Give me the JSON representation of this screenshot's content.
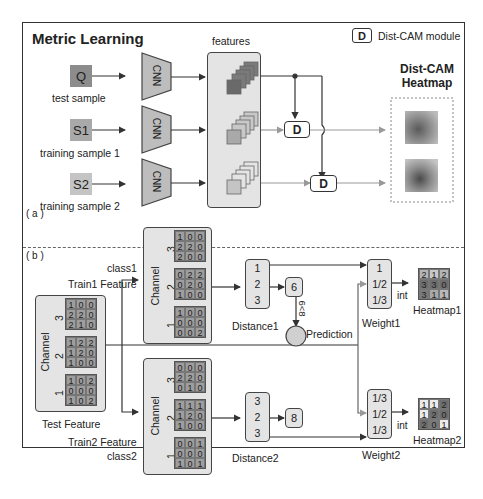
{
  "panel_a": {
    "label": "( a )",
    "title": "Metric Learning",
    "legend": {
      "icon_letter": "D",
      "text": "Dist-CAM module"
    },
    "features_label": "features",
    "heatmap_title_line1": "Dist-CAM",
    "heatmap_title_line2": "Heatmap",
    "samples": [
      {
        "letter": "Q",
        "caption": "test sample",
        "color": "#8c8c8c"
      },
      {
        "letter": "S1",
        "caption": "training sample 1",
        "color": "#a9a9a9"
      },
      {
        "letter": "S2",
        "caption": "training sample 2",
        "color": "#c4c4c4"
      }
    ],
    "cnn_label": "CNN",
    "dist_module_label": "D"
  },
  "panel_b": {
    "label": "( b )",
    "channel_label": "Channel",
    "test_feature": {
      "caption": "Test Feature",
      "channels": [
        {
          "name": "3",
          "rows": [
            [
              "1",
              "0",
              "0"
            ],
            [
              "2",
              "2",
              "0"
            ],
            [
              "2",
              "1",
              "0"
            ]
          ]
        },
        {
          "name": "2",
          "rows": [
            [
              "1",
              "2",
              "2"
            ],
            [
              "1",
              "2",
              "0"
            ],
            [
              "1",
              "0",
              "0"
            ]
          ]
        },
        {
          "name": "1",
          "rows": [
            [
              "1",
              "0",
              "2"
            ],
            [
              "0",
              "0",
              "0"
            ],
            [
              "1",
              "0",
              "2"
            ]
          ]
        }
      ]
    },
    "train1": {
      "class_label": "class1",
      "caption": "Train1 Feature",
      "channels": [
        {
          "name": "3",
          "rows": [
            [
              "1",
              "0",
              "0"
            ],
            [
              "2",
              "2",
              "0"
            ],
            [
              "2",
              "0",
              "0"
            ]
          ]
        },
        {
          "name": "2",
          "rows": [
            [
              "0",
              "2",
              "2"
            ],
            [
              "0",
              "2",
              "0"
            ],
            [
              "1",
              "0",
              "0"
            ]
          ]
        },
        {
          "name": "1",
          "rows": [
            [
              "1",
              "0",
              "0"
            ],
            [
              "0",
              "0",
              "0"
            ],
            [
              "0",
              "0",
              "2"
            ]
          ]
        }
      ]
    },
    "train2": {
      "class_label": "class2",
      "caption": "Train2 Feature",
      "channels": [
        {
          "name": "3",
          "rows": [
            [
              "0",
              "0",
              "0"
            ],
            [
              "2",
              "2",
              "0"
            ],
            [
              "0",
              "1",
              "0"
            ]
          ]
        },
        {
          "name": "2",
          "rows": [
            [
              "1",
              "1",
              "1"
            ],
            [
              "1",
              "2",
              "0"
            ],
            [
              "1",
              "0",
              "0"
            ]
          ]
        },
        {
          "name": "1",
          "rows": [
            [
              "0",
              "0",
              "1"
            ],
            [
              "0",
              "0",
              "0"
            ],
            [
              "1",
              "0",
              "1"
            ]
          ]
        }
      ]
    },
    "distance1": {
      "caption": "Distance1",
      "values": [
        "1",
        "2",
        "3"
      ],
      "sum": "6"
    },
    "distance2": {
      "caption": "Distance2",
      "values": [
        "3",
        "2",
        "3"
      ],
      "sum": "8"
    },
    "comparison": "6<8",
    "prediction_label": "Prediction",
    "weight1": {
      "caption": "Weight1",
      "values": [
        "1",
        "1/2",
        "1/3"
      ]
    },
    "weight2": {
      "caption": "Weight2",
      "values": [
        "1/3",
        "1/2",
        "1/3"
      ]
    },
    "int_label": "int",
    "heatmap1": {
      "caption": "Heatmap1",
      "rows": [
        [
          "2",
          "1",
          "2"
        ],
        [
          "3",
          "3",
          "0"
        ],
        [
          "3",
          "1",
          "1"
        ]
      ],
      "colors": [
        [
          "#b5b5b5",
          "#c8c8c8",
          "#b5b5b5"
        ],
        [
          "#6e6e6e",
          "#6e6e6e",
          "#6e6e6e"
        ],
        [
          "#7a7a7a",
          "#a9a9a9",
          "#b9b9b9"
        ]
      ]
    },
    "heatmap2": {
      "caption": "Heatmap2",
      "rows": [
        [
          "1",
          "1",
          "2"
        ],
        [
          "1",
          "2",
          "0"
        ],
        [
          "2",
          "0",
          "1"
        ]
      ],
      "colors": [
        [
          "#ececec",
          "#ececec",
          "#6e6e6e"
        ],
        [
          "#ececec",
          "#6e6e6e",
          "#6e6e6e"
        ],
        [
          "#6e6e6e",
          "#7a7a7a",
          "#ececec"
        ]
      ]
    }
  }
}
